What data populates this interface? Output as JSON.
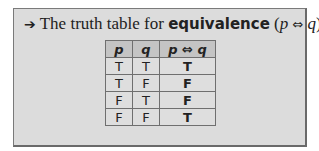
{
  "intro": {
    "arrow_icon": "right-arrow-icon",
    "prefix": "The truth table for ",
    "keyword": "equivalence",
    "paren_open": " (",
    "math_p": "p",
    "operator": " ⇔ ",
    "math_q": "q",
    "paren_close": ")",
    "suffix": " is"
  },
  "table": {
    "headers": {
      "p": "p",
      "q": "q",
      "result_p": "p",
      "result_op": " ⇔ ",
      "result_q": "q"
    },
    "rows": [
      {
        "p": "T",
        "q": "T",
        "result": "T"
      },
      {
        "p": "T",
        "q": "F",
        "result": "F"
      },
      {
        "p": "F",
        "q": "T",
        "result": "F"
      },
      {
        "p": "F",
        "q": "F",
        "result": "T"
      }
    ]
  }
}
